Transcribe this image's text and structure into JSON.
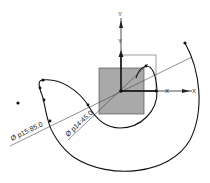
{
  "sketch": {
    "origin": {
      "x": 121,
      "y": 91
    },
    "axes": {
      "x_label": "X",
      "y_label": "Y",
      "inner_x_label": "X",
      "inner_y_label": "Y"
    },
    "square": {
      "fill": "#a9a9a9",
      "stroke": "#555555"
    },
    "curve_color": "#111111",
    "dimensions": [
      {
        "id": "p15",
        "label": "Ø p15:85.0",
        "type": "diameter"
      },
      {
        "id": "p14",
        "label": "Ø p14:45.0",
        "type": "diameter"
      }
    ]
  }
}
